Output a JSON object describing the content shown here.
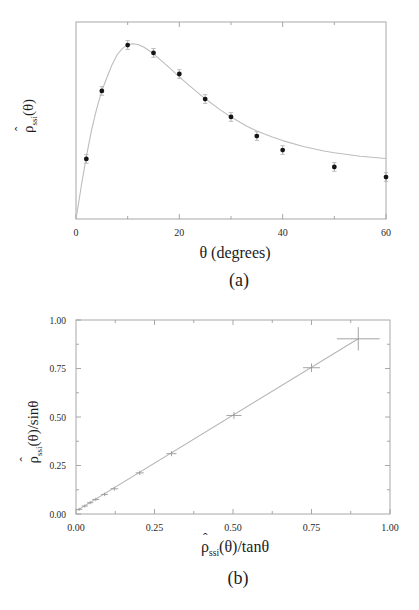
{
  "panel_a": {
    "caption": "(a)",
    "xlabel": "θ (degrees)",
    "ylabel": {
      "hat": "ˆ",
      "base": "ρ",
      "sub": "ssi",
      "rest": "(θ)"
    }
  },
  "panel_b": {
    "caption": "(b)",
    "xlabel": {
      "hat": "ˆ",
      "base": "ρ",
      "sub": "ssi",
      "rest": "(θ)/tanθ"
    },
    "ylabel": {
      "hat": "ˆ",
      "base": "ρ",
      "sub": "ssi",
      "rest": "(θ)/sinθ"
    }
  },
  "colors": {
    "frame": "#a8a8a8",
    "tick": "#9e9e9e",
    "tick_label": "#2a2a2a",
    "curve": "#bdbdbd",
    "marker": "#151515",
    "error_bar": "#b3b3b3",
    "cross": "#9a9a9a",
    "fit_line": "#b5b5b5"
  },
  "chart_data": [
    {
      "type": "scatter",
      "panel": "a",
      "marker": "dot",
      "title": "",
      "xlabel": "θ (degrees)",
      "ylabel": "ρ̂ssi(θ)",
      "xlim": [
        0,
        60
      ],
      "ylim": [
        0,
        1
      ],
      "grid": false,
      "xticks": {
        "major": [
          0,
          20,
          40,
          60
        ],
        "minor": [
          10,
          30,
          50
        ],
        "labels": [
          "0",
          "20",
          "40",
          "60"
        ]
      },
      "yticks": {
        "major": [],
        "minor": [],
        "labels": []
      },
      "points": {
        "x": [
          2,
          5,
          10,
          15,
          20,
          25,
          30,
          35,
          40,
          50,
          60
        ],
        "y": [
          0.305,
          0.65,
          0.883,
          0.843,
          0.736,
          0.609,
          0.518,
          0.421,
          0.35,
          0.264,
          0.213
        ],
        "yerr": 0.022
      },
      "fit_curve": [
        [
          0,
          0
        ],
        [
          0.5,
          0.08
        ],
        [
          1,
          0.165
        ],
        [
          2,
          0.315
        ],
        [
          3,
          0.45
        ],
        [
          4,
          0.56
        ],
        [
          5,
          0.65
        ],
        [
          6,
          0.72
        ],
        [
          7,
          0.785
        ],
        [
          8,
          0.835
        ],
        [
          9,
          0.866
        ],
        [
          10,
          0.884
        ],
        [
          11,
          0.89
        ],
        [
          12,
          0.886
        ],
        [
          13,
          0.874
        ],
        [
          14,
          0.858
        ],
        [
          15,
          0.838
        ],
        [
          16,
          0.815
        ],
        [
          18,
          0.77
        ],
        [
          20,
          0.722
        ],
        [
          22,
          0.676
        ],
        [
          25,
          0.61
        ],
        [
          28,
          0.553
        ],
        [
          30,
          0.518
        ],
        [
          33,
          0.472
        ],
        [
          35,
          0.447
        ],
        [
          38,
          0.416
        ],
        [
          40,
          0.398
        ],
        [
          44,
          0.368
        ],
        [
          48,
          0.345
        ],
        [
          50,
          0.336
        ],
        [
          55,
          0.319
        ],
        [
          60,
          0.307
        ]
      ]
    },
    {
      "type": "scatter",
      "panel": "b",
      "marker": "cross",
      "title": "",
      "xlabel": "ρ̂ssi(θ)/tanθ",
      "ylabel": "ρ̂ssi(θ)/sinθ",
      "xlim": [
        0,
        1
      ],
      "ylim": [
        0,
        1
      ],
      "grid": false,
      "xticks": {
        "major": [
          0,
          0.25,
          0.5,
          0.75,
          1
        ],
        "minor": [
          0.125,
          0.375,
          0.625,
          0.875
        ],
        "labels": [
          "0.00",
          "0.25",
          "0.50",
          "0.75",
          "1.00"
        ]
      },
      "yticks": {
        "major": [
          0,
          0.25,
          0.5,
          0.75,
          1
        ],
        "minor": [
          0.125,
          0.375,
          0.625,
          0.875
        ],
        "labels": [
          "0.00",
          "0.25",
          "0.50",
          "0.75",
          "1.00"
        ]
      },
      "points": {
        "x": [
          0.01,
          0.028,
          0.045,
          0.063,
          0.091,
          0.122,
          0.203,
          0.304,
          0.503,
          0.75,
          0.899
        ],
        "y": [
          0.024,
          0.041,
          0.058,
          0.075,
          0.101,
          0.13,
          0.212,
          0.311,
          0.508,
          0.754,
          0.903
        ],
        "xerr": [
          0.01,
          0.01,
          0.01,
          0.011,
          0.011,
          0.012,
          0.013,
          0.016,
          0.024,
          0.027,
          0.068
        ],
        "yerr": [
          0.008,
          0.008,
          0.008,
          0.009,
          0.009,
          0.01,
          0.011,
          0.013,
          0.018,
          0.022,
          0.06
        ]
      },
      "fit_line": {
        "x": [
          0.005,
          0.9
        ],
        "y": [
          0.02,
          0.905
        ]
      }
    }
  ]
}
